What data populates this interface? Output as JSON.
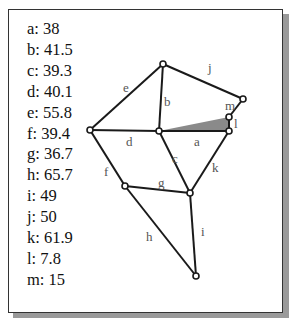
{
  "measurements": [
    {
      "key": "a",
      "value": "38"
    },
    {
      "key": "b",
      "value": "41.5"
    },
    {
      "key": "c",
      "value": "39.3"
    },
    {
      "key": "d",
      "value": "40.1"
    },
    {
      "key": "e",
      "value": "55.8"
    },
    {
      "key": "f",
      "value": "39.4"
    },
    {
      "key": "g",
      "value": "36.7"
    },
    {
      "key": "h",
      "value": "65.7"
    },
    {
      "key": "i",
      "value": "49"
    },
    {
      "key": "j",
      "value": "50"
    },
    {
      "key": "k",
      "value": "61.9"
    },
    {
      "key": "l",
      "value": "7.8"
    },
    {
      "key": "m",
      "value": "15"
    }
  ],
  "diagram": {
    "edges": [
      {
        "label": "a",
        "from": "C",
        "to": "F"
      },
      {
        "label": "b",
        "from": "B",
        "to": "C"
      },
      {
        "label": "c",
        "from": "C",
        "to": "H"
      },
      {
        "label": "d",
        "from": "A",
        "to": "C"
      },
      {
        "label": "e",
        "from": "A",
        "to": "B"
      },
      {
        "label": "f",
        "from": "A",
        "to": "G"
      },
      {
        "label": "g",
        "from": "G",
        "to": "H"
      },
      {
        "label": "h",
        "from": "G",
        "to": "I"
      },
      {
        "label": "i",
        "from": "H",
        "to": "I"
      },
      {
        "label": "j",
        "from": "B",
        "to": "D"
      },
      {
        "label": "k",
        "from": "F",
        "to": "H"
      },
      {
        "label": "l",
        "from": "E",
        "to": "F"
      },
      {
        "label": "m",
        "from": "D",
        "to": "E"
      }
    ],
    "shaded_triangle": [
      "C",
      "E",
      "F"
    ],
    "shade_color": "#8a8a8a",
    "edge_color": "#1a1a1a"
  }
}
